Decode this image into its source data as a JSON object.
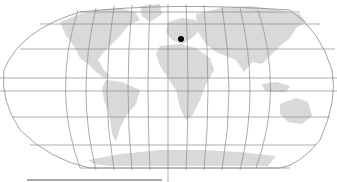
{
  "map": {
    "projection": "robinson",
    "colors": {
      "background": "#ffffff",
      "land": "#d9d9d9",
      "graticule": "#8a8a8a",
      "marker": "#000000"
    },
    "marker": {
      "label": "location-marker",
      "x": 181,
      "y": 39
    },
    "equator_y": 91,
    "central_meridian_x": 168
  }
}
